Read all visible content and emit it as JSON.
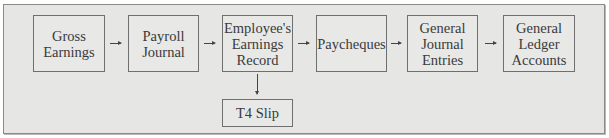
{
  "diagram": {
    "type": "flowchart",
    "direction": "left-to-right",
    "nodes": [
      {
        "id": "gross_earnings",
        "lines": [
          "Gross",
          "Earnings"
        ]
      },
      {
        "id": "payroll_journal",
        "lines": [
          "Payroll",
          "Journal"
        ]
      },
      {
        "id": "employees_earnings_record",
        "lines": [
          "Employee's",
          "Earnings",
          "Record"
        ]
      },
      {
        "id": "paycheques",
        "lines": [
          "Paycheques"
        ]
      },
      {
        "id": "general_journal_entries",
        "lines": [
          "General",
          "Journal",
          "Entries"
        ]
      },
      {
        "id": "general_ledger_accounts",
        "lines": [
          "General",
          "Ledger",
          "Accounts"
        ]
      },
      {
        "id": "t4_slip",
        "lines": [
          "T4 Slip"
        ]
      }
    ],
    "edges": [
      {
        "from": "gross_earnings",
        "to": "payroll_journal"
      },
      {
        "from": "payroll_journal",
        "to": "employees_earnings_record"
      },
      {
        "from": "employees_earnings_record",
        "to": "paycheques"
      },
      {
        "from": "paycheques",
        "to": "general_journal_entries"
      },
      {
        "from": "general_journal_entries",
        "to": "general_ledger_accounts"
      },
      {
        "from": "employees_earnings_record",
        "to": "t4_slip"
      }
    ]
  }
}
